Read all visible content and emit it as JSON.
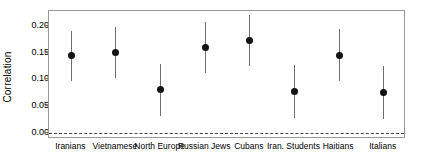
{
  "chart_data": {
    "type": "scatter",
    "title": "",
    "subtitle": "",
    "xlabel": "",
    "ylabel": "Correlation",
    "categories": [
      "Iranians",
      "Vietnamese",
      "North Europe",
      "Russian Jews",
      "Cubans",
      "Iran. Students",
      "Haitians",
      "Italians"
    ],
    "values": [
      0.145,
      0.15,
      0.081,
      0.159,
      0.173,
      0.078,
      0.145,
      0.075
    ],
    "error_low": [
      0.096,
      0.102,
      0.031,
      0.111,
      0.125,
      0.028,
      0.096,
      0.025
    ],
    "error_high": [
      0.19,
      0.198,
      0.129,
      0.207,
      0.22,
      0.126,
      0.195,
      0.124
    ],
    "ylim": [
      -0.012,
      0.228
    ],
    "yticks": [
      0.0,
      0.05,
      0.1,
      0.15,
      0.2
    ],
    "ytick_labels": [
      "0.00",
      "0.05",
      "0.10",
      "0.15",
      "0.20"
    ],
    "grid": false,
    "legend": null,
    "annotations": [
      {
        "name": "zero-reference-line",
        "y": 0.0,
        "style": "dashed"
      }
    ],
    "colors": {
      "point": "#121212",
      "whisker": "#6e6e6e",
      "panel_border": "#9a9a9a",
      "zero_line": "#444444",
      "background": "#ffffff",
      "text": "#000000"
    }
  }
}
